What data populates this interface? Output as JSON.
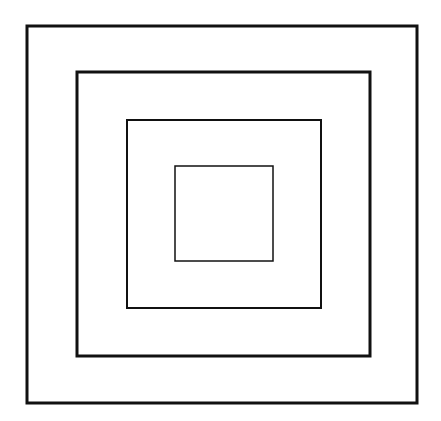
{
  "diagram": {
    "type": "nested-squares",
    "background": "#ffffff",
    "stroke_color": "#111111",
    "squares": [
      {
        "name": "outer-square",
        "x": 27,
        "y": 26,
        "w": 390,
        "h": 377,
        "stroke_width": 3
      },
      {
        "name": "second-square",
        "x": 77,
        "y": 72,
        "w": 293,
        "h": 284,
        "stroke_width": 3
      },
      {
        "name": "third-square",
        "x": 127,
        "y": 120,
        "w": 194,
        "h": 188,
        "stroke_width": 2
      },
      {
        "name": "inner-square",
        "x": 175,
        "y": 166,
        "w": 98,
        "h": 95,
        "stroke_width": 1.5
      }
    ]
  }
}
